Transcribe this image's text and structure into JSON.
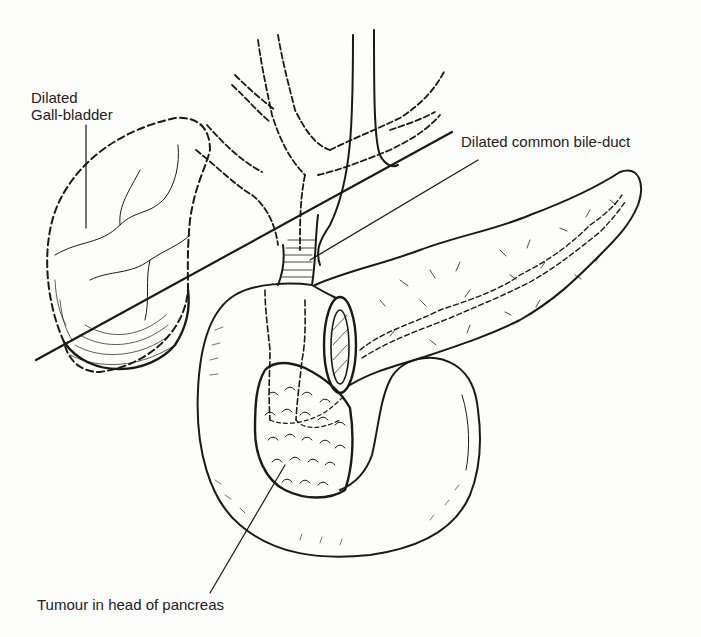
{
  "figure": {
    "background": "#fdfdfc",
    "ink_color": "#1a1a1a",
    "labels": {
      "gall_bladder_line1": "Dilated",
      "gall_bladder_line2": "Gall-bladder",
      "common_bile_duct": "Dilated common bile-duct",
      "tumour": "Tumour in head of pancreas"
    },
    "structures": [
      "gall-bladder",
      "hepatic-ducts",
      "common-bile-duct",
      "duodenum",
      "pancreas",
      "pancreatic-duct",
      "tumour",
      "peritoneal-incision-lines"
    ]
  }
}
